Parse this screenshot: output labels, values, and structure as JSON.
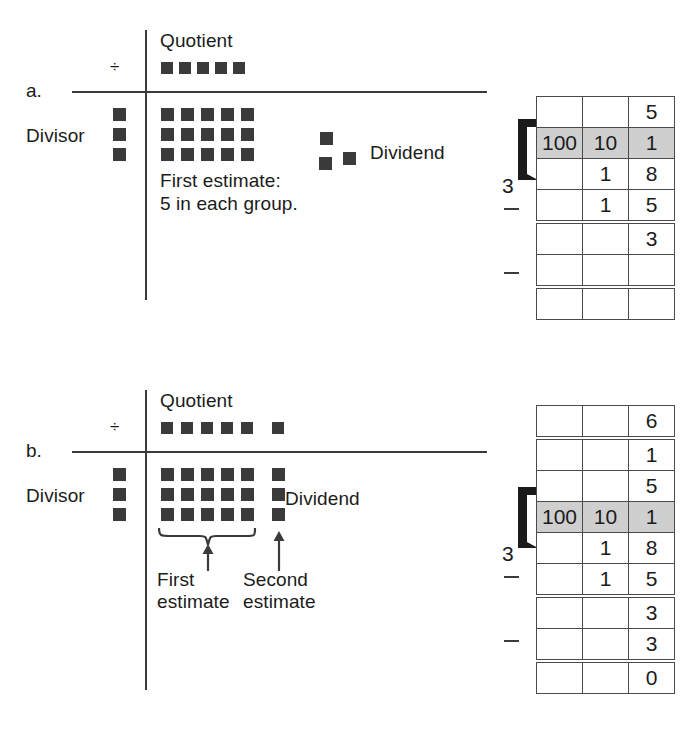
{
  "figure": {
    "ink_color": "#3a3a3a",
    "highlight_color": "#cfcfcf"
  },
  "panels": [
    {
      "letter": "a.",
      "divide_symbol": "÷",
      "labels": {
        "quotient": "Quotient",
        "divisor": "Divisor",
        "dividend": "Dividend",
        "note_line1": "First estimate:",
        "note_line2": "5 in each group."
      },
      "counts": {
        "quotient_squares": 5,
        "quotient_extra_squares": 0,
        "divisor_squares": 3,
        "array_cols": 5,
        "array_rows": 3,
        "remainder_squares": 3
      },
      "table": {
        "divisor_digit": "3",
        "columns": [
          "100",
          "10",
          "1"
        ],
        "rows": [
          {
            "cells": [
              "",
              "",
              "5"
            ],
            "style": "plain"
          },
          {
            "cells": [
              "100",
              "10",
              "1"
            ],
            "style": "header"
          },
          {
            "cells": [
              "",
              "1",
              "8"
            ],
            "style": "plain"
          },
          {
            "cells": [
              "",
              "1",
              "5"
            ],
            "style": "plain"
          },
          {
            "cells": [
              "",
              "",
              "3"
            ],
            "style": "double-top"
          },
          {
            "cells": [
              "",
              "",
              ""
            ],
            "style": "plain"
          },
          {
            "cells": [
              "",
              "",
              ""
            ],
            "style": "double-top"
          }
        ],
        "minus_signs": 2
      }
    },
    {
      "letter": "b.",
      "divide_symbol": "÷",
      "labels": {
        "quotient": "Quotient",
        "divisor": "Divisor",
        "dividend": "Dividend",
        "brace_label_line1": "First",
        "brace_label_line2": "estimate",
        "arrow_label_line1": "Second",
        "arrow_label_line2": "estimate"
      },
      "counts": {
        "quotient_squares": 5,
        "quotient_extra_squares": 1,
        "divisor_squares": 3,
        "array_cols": 5,
        "array_rows": 3,
        "second_group_squares": 3
      },
      "table": {
        "divisor_digit": "3",
        "columns": [
          "100",
          "10",
          "1"
        ],
        "rows": [
          {
            "cells": [
              "",
              "",
              "6"
            ],
            "style": "plain"
          },
          {
            "cells": [
              "",
              "",
              "1"
            ],
            "style": "double-top"
          },
          {
            "cells": [
              "",
              "",
              "5"
            ],
            "style": "plain"
          },
          {
            "cells": [
              "100",
              "10",
              "1"
            ],
            "style": "header"
          },
          {
            "cells": [
              "",
              "1",
              "8"
            ],
            "style": "plain"
          },
          {
            "cells": [
              "",
              "1",
              "5"
            ],
            "style": "plain"
          },
          {
            "cells": [
              "",
              "",
              "3"
            ],
            "style": "double-top"
          },
          {
            "cells": [
              "",
              "",
              "3"
            ],
            "style": "plain"
          },
          {
            "cells": [
              "",
              "",
              "0"
            ],
            "style": "double-top"
          }
        ],
        "minus_signs": 2
      }
    }
  ]
}
